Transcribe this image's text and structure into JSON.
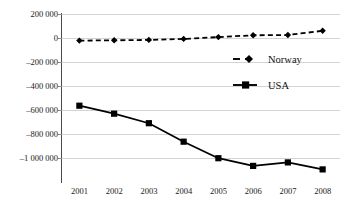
{
  "chart_data": {
    "type": "line",
    "title": "",
    "subtitle": "",
    "xlabel": "",
    "ylabel": "",
    "categories": [
      "2001",
      "2002",
      "2003",
      "2004",
      "2005",
      "2006",
      "2007",
      "2008"
    ],
    "series": [
      {
        "name": "Norway",
        "values": [
          10000,
          12000,
          15000,
          22000,
          35000,
          48000,
          50000,
          80000
        ],
        "line_style": "dashed",
        "marker": "diamond",
        "color": "#000000"
      },
      {
        "name": "USA",
        "values": [
          -455000,
          -512000,
          -580000,
          -712000,
          -830000,
          -885000,
          -860000,
          -910000
        ],
        "line_style": "solid",
        "marker": "square",
        "color": "#000000"
      }
    ],
    "ylim": [
      -1000000,
      200000
    ],
    "yticks": [
      200000,
      0,
      -200000,
      -400000,
      -600000,
      -800000,
      -1000000
    ],
    "ytick_labels": [
      "200 000",
      "0",
      "–200 000",
      "–400 000",
      "–600 000",
      "–800 000",
      "–1 000 000"
    ],
    "grid": "horizontal",
    "grid_color": "#d3d3d3",
    "axis_color": "#4a4a4a",
    "legend_position": "inside-right-center",
    "legend": [
      {
        "label": "Norway",
        "marker": "diamond",
        "line_style": "dashed"
      },
      {
        "label": "USA",
        "marker": "square",
        "line_style": "solid"
      }
    ],
    "background": "#ffffff"
  }
}
